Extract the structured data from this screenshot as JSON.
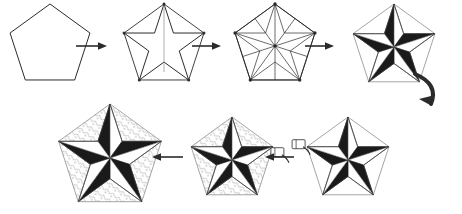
{
  "diagram": {
    "background_color": "#ffffff",
    "ink_color": "#2b2b2b",
    "shade_dark": "#1a1a1a",
    "shade_light": "#ffffff",
    "texture_color": "#b9b9b9",
    "step_count": 7,
    "flow": "left-to-right on top row, wrap via curved arrow, right-to-left on bottom row"
  },
  "steps": [
    {
      "id": "step-1",
      "name": "plain-pentagon",
      "label": "Plain pentagon",
      "row": "top",
      "order": 1,
      "cx": 50,
      "cy": 46,
      "r": 42,
      "style": "outline",
      "shaded": false,
      "creases": "none",
      "textured": false,
      "hand": "none"
    },
    {
      "id": "step-2",
      "name": "folded-star-outline",
      "label": "Pentagon collapsed into star outline",
      "row": "top",
      "order": 2,
      "cx": 164,
      "cy": 46,
      "r": 42,
      "style": "star-outline",
      "shaded": false,
      "creases": "star-spine",
      "textured": false,
      "hand": "none"
    },
    {
      "id": "step-3",
      "name": "crease-pattern",
      "label": "Full crease pattern with vertices",
      "row": "top",
      "order": 3,
      "cx": 275,
      "cy": 46,
      "r": 42,
      "style": "crease-pattern",
      "shaded": false,
      "creases": "full",
      "vertices": true,
      "textured": false,
      "hand": "none"
    },
    {
      "id": "step-4",
      "name": "shaded-star-small",
      "label": "Star with alternating black and white facets",
      "row": "top",
      "order": 4,
      "cx": 394,
      "cy": 47,
      "r": 43,
      "style": "shaded-star",
      "shaded": true,
      "creases": "light",
      "textured": false,
      "hand": "none"
    },
    {
      "id": "step-5",
      "name": "shaded-star-hand-upper-left",
      "label": "Adjusting the upper-left point",
      "row": "bottom",
      "order": 5,
      "cx": 348,
      "cy": 160,
      "r": 43,
      "style": "shaded-star",
      "shaded": true,
      "creases": "light",
      "textured": false,
      "hand": "upper-left"
    },
    {
      "id": "step-6",
      "name": "shaded-star-hand-right",
      "label": "Adjusting the right point",
      "row": "bottom",
      "order": 6,
      "cx": 232,
      "cy": 160,
      "r": 43,
      "style": "shaded-star",
      "shaded": true,
      "creases": "light",
      "textured": true,
      "hand": "right"
    },
    {
      "id": "step-7",
      "name": "finished-textured-star",
      "label": "Finished star with decorated paper",
      "row": "bottom",
      "order": 7,
      "cx": 110,
      "cy": 158,
      "r": 54,
      "style": "shaded-star",
      "shaded": true,
      "creases": "light",
      "textured": true,
      "hand": "none"
    }
  ],
  "arrows": [
    {
      "id": "arrow-1",
      "name": "arrow-step1-to-step2",
      "direction": "right",
      "x": 92,
      "y": 46,
      "length": 28,
      "label": "next step"
    },
    {
      "id": "arrow-2",
      "name": "arrow-step2-to-step3",
      "direction": "right",
      "x": 207,
      "y": 46,
      "length": 26,
      "label": "next step"
    },
    {
      "id": "arrow-3",
      "name": "arrow-step3-to-step4",
      "direction": "right",
      "x": 320,
      "y": 46,
      "length": 26,
      "label": "next step"
    },
    {
      "id": "arrow-4",
      "name": "arrow-wrap-curved",
      "direction": "curve-down-left",
      "x": 424,
      "y": 92,
      "length": 44,
      "label": "continue on next row"
    },
    {
      "id": "arrow-5",
      "name": "arrow-step5-to-step6",
      "direction": "left",
      "x": 280,
      "y": 157,
      "length": 26,
      "label": "next step"
    },
    {
      "id": "arrow-6",
      "name": "arrow-step6-to-step7",
      "direction": "left",
      "x": 168,
      "y": 157,
      "length": 28,
      "label": "next step"
    }
  ]
}
